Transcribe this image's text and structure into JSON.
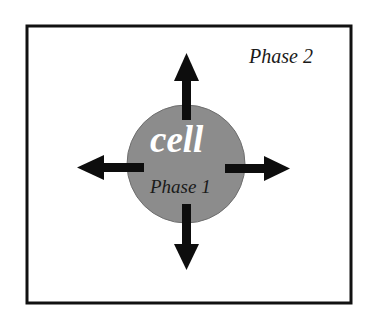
{
  "diagram": {
    "outer_region_label": "Phase 2",
    "cell_label": "cell",
    "inner_region_label": "Phase 1",
    "arrows": [
      "up",
      "down",
      "left",
      "right"
    ],
    "colors": {
      "border": "#111111",
      "cell_fill": "#8c8c8c",
      "cell_outline": "#6e6e6e",
      "cell_text": "#ffffff",
      "arrow": "#0d0d0d",
      "text": "#1a1a1a"
    }
  }
}
